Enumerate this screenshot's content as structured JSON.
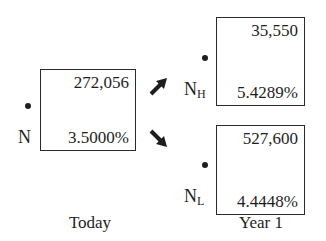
{
  "today": {
    "label": "Today",
    "node": {
      "symbol": "N",
      "subscript": "",
      "value": "272,056",
      "rate": "3.5000%"
    }
  },
  "year1": {
    "label": "Year 1",
    "high": {
      "symbol": "N",
      "subscript": "H",
      "value": "35,550",
      "rate": "5.4289%"
    },
    "low": {
      "symbol": "N",
      "subscript": "L",
      "value": "527,600",
      "rate": "4.4448%"
    }
  },
  "icons": {
    "up_arrow": "arrow-up-right",
    "down_arrow": "arrow-down-right"
  }
}
